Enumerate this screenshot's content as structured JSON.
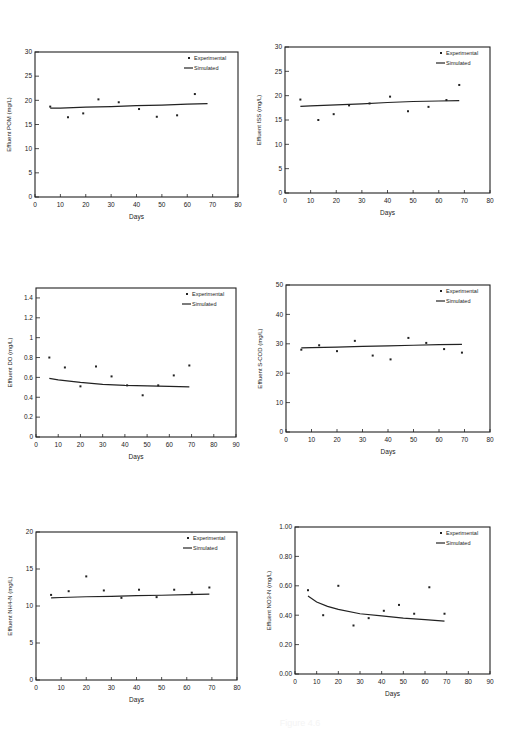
{
  "chart_data": [
    {
      "id": "pom",
      "type": "scatter",
      "title": "",
      "xlabel": "Days",
      "ylabel": "Effluent POM (mg/L)",
      "xlim": [
        0,
        80
      ],
      "ylim": [
        0,
        30
      ],
      "xticks": [
        0,
        10,
        20,
        30,
        40,
        50,
        60,
        70,
        80
      ],
      "yticks": [
        0,
        5,
        10,
        15,
        20,
        25,
        30
      ],
      "legend": [
        "Experimental",
        "Simulated"
      ],
      "legend_position": "upper right",
      "grid": false,
      "series": [
        {
          "name": "Experimental",
          "kind": "points",
          "x": [
            6,
            13,
            19,
            25,
            33,
            41,
            48,
            56,
            63
          ],
          "y": [
            18.7,
            16.5,
            17.3,
            20.2,
            19.6,
            18.2,
            16.6,
            16.9,
            21.3
          ]
        },
        {
          "name": "Simulated",
          "kind": "line",
          "x": [
            6,
            10,
            20,
            30,
            40,
            50,
            60,
            68
          ],
          "y": [
            18.4,
            18.4,
            18.6,
            18.7,
            18.9,
            19.0,
            19.2,
            19.3
          ]
        }
      ]
    },
    {
      "id": "iss",
      "type": "scatter",
      "title": "",
      "xlabel": "Days",
      "ylabel": "Effluent ISS (mg/L)",
      "xlim": [
        0,
        80
      ],
      "ylim": [
        0,
        30
      ],
      "xticks": [
        0,
        10,
        20,
        30,
        40,
        50,
        60,
        70,
        80
      ],
      "yticks": [
        0,
        5,
        10,
        15,
        20,
        25,
        30
      ],
      "legend": [
        "Experimental",
        "Simulated"
      ],
      "legend_position": "upper right",
      "grid": false,
      "series": [
        {
          "name": "Experimental",
          "kind": "points",
          "x": [
            6,
            13,
            19,
            25,
            33,
            41,
            48,
            56,
            63,
            68
          ],
          "y": [
            19.2,
            15.0,
            16.2,
            18.0,
            18.4,
            19.8,
            16.8,
            17.7,
            19.1,
            22.2
          ]
        },
        {
          "name": "Simulated",
          "kind": "line",
          "x": [
            6,
            10,
            20,
            30,
            40,
            50,
            60,
            68
          ],
          "y": [
            17.8,
            17.9,
            18.1,
            18.3,
            18.6,
            18.8,
            18.9,
            19.0
          ]
        }
      ]
    },
    {
      "id": "do",
      "type": "scatter",
      "title": "",
      "xlabel": "Days",
      "ylabel": "Effluent DO (mg/L)",
      "xlim": [
        0,
        90
      ],
      "ylim": [
        0,
        1.5
      ],
      "xticks": [
        0,
        10,
        20,
        30,
        40,
        50,
        60,
        70,
        80,
        90
      ],
      "yticks": [
        0.0,
        0.2,
        0.4,
        0.6,
        0.8,
        1.0,
        1.2,
        1.4
      ],
      "legend": [
        "Experimental",
        "Simulated"
      ],
      "legend_position": "upper right",
      "grid": false,
      "series": [
        {
          "name": "Experimental",
          "kind": "points",
          "x": [
            6,
            13,
            20,
            27,
            34,
            41,
            48,
            55,
            62,
            69
          ],
          "y": [
            0.8,
            0.7,
            0.51,
            0.71,
            0.61,
            0.52,
            0.42,
            0.52,
            0.62,
            0.72
          ]
        },
        {
          "name": "Simulated",
          "kind": "line",
          "x": [
            6,
            10,
            20,
            30,
            40,
            50,
            60,
            69
          ],
          "y": [
            0.59,
            0.575,
            0.55,
            0.53,
            0.52,
            0.515,
            0.51,
            0.505
          ]
        }
      ]
    },
    {
      "id": "scod",
      "type": "scatter",
      "title": "",
      "xlabel": "Days",
      "ylabel": "Effluent S-COD (mg/L)",
      "xlim": [
        0,
        80
      ],
      "ylim": [
        0,
        50
      ],
      "xticks": [
        0,
        10,
        20,
        30,
        40,
        50,
        60,
        70,
        80
      ],
      "yticks": [
        0,
        10,
        20,
        30,
        40,
        50
      ],
      "legend": [
        "Experimental",
        "Simulated"
      ],
      "legend_position": "upper right",
      "grid": false,
      "series": [
        {
          "name": "Experimental",
          "kind": "points",
          "x": [
            6,
            13,
            20,
            27,
            34,
            41,
            48,
            55,
            62,
            69
          ],
          "y": [
            28.0,
            29.5,
            27.5,
            31.0,
            26.0,
            24.7,
            32.0,
            30.3,
            28.2,
            27.0
          ]
        },
        {
          "name": "Simulated",
          "kind": "line",
          "x": [
            6,
            10,
            20,
            30,
            40,
            50,
            60,
            69
          ],
          "y": [
            28.6,
            28.7,
            28.9,
            29.1,
            29.3,
            29.5,
            29.7,
            29.8
          ]
        }
      ]
    },
    {
      "id": "nh4n",
      "type": "scatter",
      "title": "",
      "xlabel": "Days",
      "ylabel": "Effluent NH4-N (mg/L)",
      "xlim": [
        0,
        80
      ],
      "ylim": [
        0,
        20
      ],
      "xticks": [
        0,
        10,
        20,
        30,
        40,
        50,
        60,
        70,
        80
      ],
      "yticks": [
        0,
        5,
        10,
        15,
        20
      ],
      "legend": [
        "Experimental",
        "Simulated"
      ],
      "legend_position": "upper right",
      "grid": false,
      "series": [
        {
          "name": "Experimental",
          "kind": "points",
          "x": [
            6,
            13,
            20,
            27,
            34,
            41,
            48,
            55,
            62,
            69
          ],
          "y": [
            11.5,
            12.0,
            14.0,
            12.1,
            11.1,
            12.2,
            11.2,
            12.2,
            11.8,
            12.5
          ]
        },
        {
          "name": "Simulated",
          "kind": "line",
          "x": [
            6,
            10,
            20,
            30,
            40,
            50,
            60,
            69
          ],
          "y": [
            11.1,
            11.15,
            11.25,
            11.3,
            11.4,
            11.45,
            11.55,
            11.6
          ]
        }
      ]
    },
    {
      "id": "no3n",
      "type": "scatter",
      "title": "",
      "xlabel": "Days",
      "ylabel": "Effluent NO3-N (mg/L)",
      "xlim": [
        0,
        90
      ],
      "ylim": [
        0,
        1.0
      ],
      "xticks": [
        0,
        10,
        20,
        30,
        40,
        50,
        60,
        70,
        80,
        90
      ],
      "yticks": [
        0.0,
        0.2,
        0.4,
        0.6,
        0.8,
        1.0
      ],
      "ytick_labels": [
        "0.00",
        "0.20",
        "0.40",
        "0.60",
        "0.80",
        "1.00"
      ],
      "legend": [
        "Experimental",
        "Simulated"
      ],
      "legend_position": "upper right",
      "grid": false,
      "series": [
        {
          "name": "Experimental",
          "kind": "points",
          "x": [
            6,
            13,
            20,
            27,
            34,
            41,
            48,
            55,
            62,
            69
          ],
          "y": [
            0.57,
            0.4,
            0.6,
            0.33,
            0.38,
            0.43,
            0.47,
            0.41,
            0.59,
            0.41
          ]
        },
        {
          "name": "Simulated",
          "kind": "line",
          "x": [
            6,
            10,
            15,
            20,
            30,
            40,
            50,
            60,
            69
          ],
          "y": [
            0.53,
            0.49,
            0.46,
            0.44,
            0.41,
            0.395,
            0.38,
            0.37,
            0.36
          ]
        }
      ]
    }
  ],
  "layout": {
    "panels": [
      {
        "id": "pom",
        "left": 35,
        "top": 52,
        "width": 203,
        "height": 145
      },
      {
        "id": "iss",
        "left": 285,
        "top": 47,
        "width": 205,
        "height": 146
      },
      {
        "id": "do",
        "left": 36,
        "top": 288,
        "width": 200,
        "height": 149
      },
      {
        "id": "scod",
        "left": 286,
        "top": 285,
        "width": 204,
        "height": 147
      },
      {
        "id": "nh4n",
        "left": 36,
        "top": 532,
        "width": 201,
        "height": 148
      },
      {
        "id": "no3n",
        "left": 295,
        "top": 527,
        "width": 195,
        "height": 147
      }
    ]
  },
  "colors": {
    "ink": "#222222",
    "background": "#ffffff"
  },
  "caption": "Figure 4.6"
}
